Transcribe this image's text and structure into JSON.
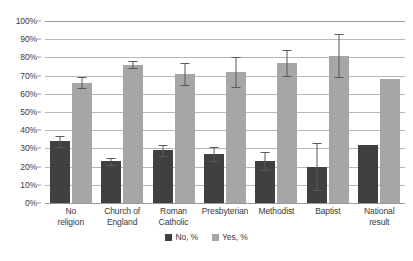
{
  "chart_data": {
    "type": "bar",
    "title": "",
    "subtitle": "",
    "xlabel": "",
    "ylabel": "",
    "ylim": [
      0,
      100
    ],
    "ytick_labels": [
      "0%",
      "10%",
      "20%",
      "30%",
      "40%",
      "50%",
      "60%",
      "70%",
      "80%",
      "90%",
      "100%"
    ],
    "ytick_values": [
      0,
      10,
      20,
      30,
      40,
      50,
      60,
      70,
      80,
      90,
      100
    ],
    "grid": true,
    "legend_position": "bottom",
    "error_bars": true,
    "categories": [
      "No religion",
      "Church of England",
      "Roman Catholic",
      "Presbyterian",
      "Methodist",
      "Baptist",
      "National result"
    ],
    "series": [
      {
        "name": "No, %",
        "color": "#404040",
        "values": [
          34,
          23,
          29,
          27,
          23,
          20,
          32
        ],
        "err_low": [
          3,
          2,
          3,
          4,
          5,
          13,
          0
        ],
        "err_high": [
          3,
          2,
          3,
          4,
          5,
          13,
          0
        ]
      },
      {
        "name": "Yes, %",
        "color": "#a6a6a6",
        "values": [
          66,
          76,
          71,
          72,
          77,
          81,
          68
        ],
        "err_low": [
          3,
          2,
          6,
          8,
          7,
          12,
          0
        ],
        "err_high": [
          3,
          2,
          6,
          8,
          7,
          12,
          0
        ]
      }
    ]
  },
  "legend": {
    "items": [
      {
        "label": "No, %"
      },
      {
        "label": "Yes, %"
      }
    ]
  },
  "axis": {
    "y_labels": [
      "100%",
      "90%",
      "80%",
      "70%",
      "60%",
      "50%",
      "40%",
      "30%",
      "20%",
      "10%",
      "0%"
    ]
  },
  "x_labels": [
    {
      "line1": "No",
      "line2": "religion"
    },
    {
      "line1": "Church of",
      "line2": "England"
    },
    {
      "line1": "Roman",
      "line2": "Catholic"
    },
    {
      "line1": "Presbyterian",
      "line2": ""
    },
    {
      "line1": "Methodist",
      "line2": ""
    },
    {
      "line1": "Baptist",
      "line2": ""
    },
    {
      "line1": "National",
      "line2": "result"
    }
  ],
  "colors": {
    "no": "#404040",
    "yes": "#a6a6a6",
    "grid": "#b7b7b7",
    "axis": "#9a9a9a",
    "error": "#595959",
    "text": "#3a3a3a",
    "background": "#ffffff"
  }
}
